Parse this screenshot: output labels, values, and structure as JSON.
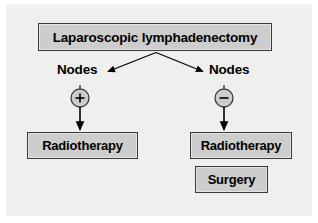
{
  "diagram": {
    "canvas": {
      "width": 318,
      "height": 223
    },
    "colors": {
      "background": "#ffffff",
      "panel": "#efefee",
      "box_fill": "#cdcdcd",
      "box_border": "#3a3a3a",
      "text": "#000000",
      "connector": "#000000"
    },
    "root": {
      "label": "Laparoscopic lymphadenectomy"
    },
    "branches": [
      {
        "side": "left",
        "condition_label": "Nodes",
        "sign": "+",
        "sign_name": "plus-sign",
        "outcomes": [
          {
            "label": "Radiotherapy"
          }
        ]
      },
      {
        "side": "right",
        "condition_label": "Nodes",
        "sign": "−",
        "sign_name": "minus-sign",
        "outcomes": [
          {
            "label": "Radiotherapy"
          },
          {
            "label": "Surgery"
          }
        ]
      }
    ]
  }
}
